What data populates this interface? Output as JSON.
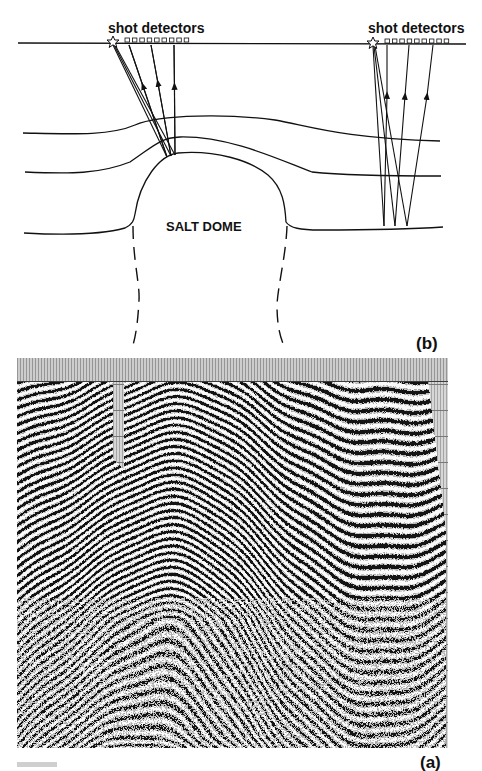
{
  "figure": {
    "panel_b": {
      "label": "(b)",
      "left_array": {
        "label": "shot detectors",
        "shot_icon": "star-icon",
        "detector_count": 9
      },
      "right_array": {
        "label": "shot detectors",
        "shot_icon": "star-icon",
        "detector_count": 9
      },
      "structure_label": "SALT DOME"
    },
    "panel_a": {
      "label": "(a)",
      "description": "seismic reflection section"
    }
  },
  "colors": {
    "ink": "#111111",
    "background": "#ffffff",
    "trace_header": "#b8b8b8",
    "section_gray": "#d4d4d4"
  }
}
